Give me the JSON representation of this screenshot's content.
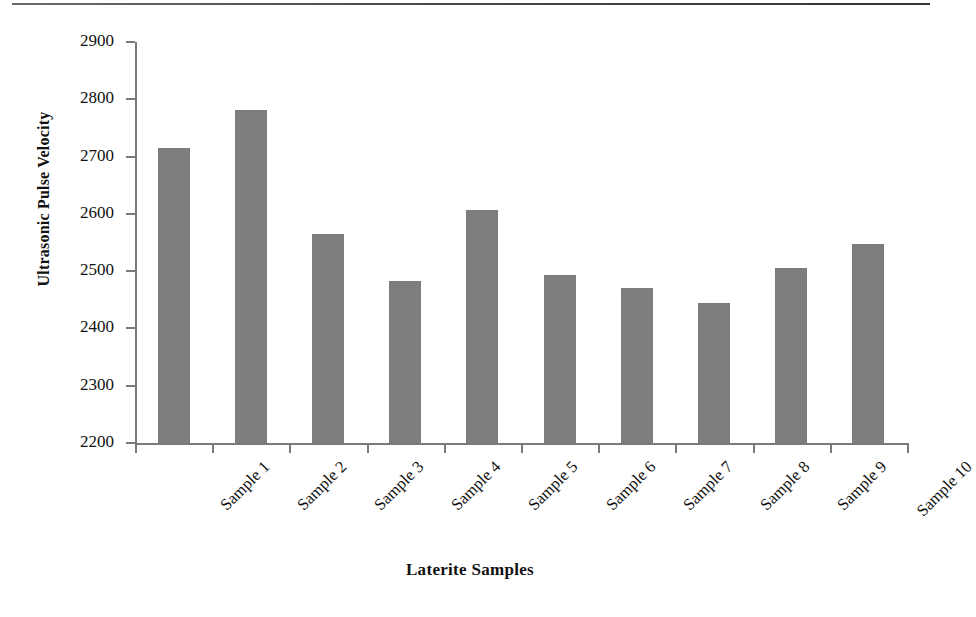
{
  "chart_data": {
    "type": "bar",
    "title": "",
    "xlabel": "Laterite Samples",
    "ylabel": "Ultrasonic Pulse Velocity",
    "categories": [
      "Sample 1",
      "Sample 2",
      "Sample 3",
      "Sample 4",
      "Sample 5",
      "Sample 6",
      "Sample 7",
      "Sample 8",
      "Sample 9",
      "Sample 10"
    ],
    "values": [
      2715,
      2782,
      2564,
      2483,
      2606,
      2494,
      2471,
      2445,
      2505,
      2547
    ],
    "ylim": [
      2200,
      2900
    ],
    "ytick_labels": [
      "2900",
      "2800",
      "2700",
      "2600",
      "2500",
      "2400",
      "2300",
      "2200"
    ],
    "ytick_values": [
      2900,
      2800,
      2700,
      2600,
      2500,
      2400,
      2300,
      2200
    ],
    "grid": false,
    "legend": false,
    "legend_position": "none",
    "series": [
      {
        "name": "Ultrasonic Pulse Velocity",
        "color": "#7e7e7e",
        "values": [
          2715,
          2782,
          2564,
          2483,
          2606,
          2494,
          2471,
          2445,
          2505,
          2547
        ]
      }
    ],
    "bar_color": "#7e7e7e",
    "axis_color": "#7a7a7a"
  }
}
